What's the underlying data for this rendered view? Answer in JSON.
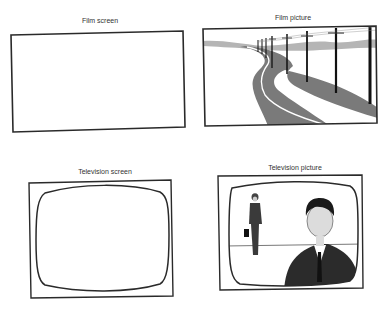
{
  "panels": {
    "film_screen": {
      "label": "Film screen"
    },
    "film_picture": {
      "label": "Film picture"
    },
    "television_screen": {
      "label": "Television screen"
    },
    "television_picture": {
      "label": "Television picture"
    }
  },
  "colors": {
    "frame": "#2a2a2a",
    "road": "#7a7a7a",
    "hills": "#b5b5b5",
    "suit": "#2b2b2b",
    "skin": "#dcdcdc"
  }
}
